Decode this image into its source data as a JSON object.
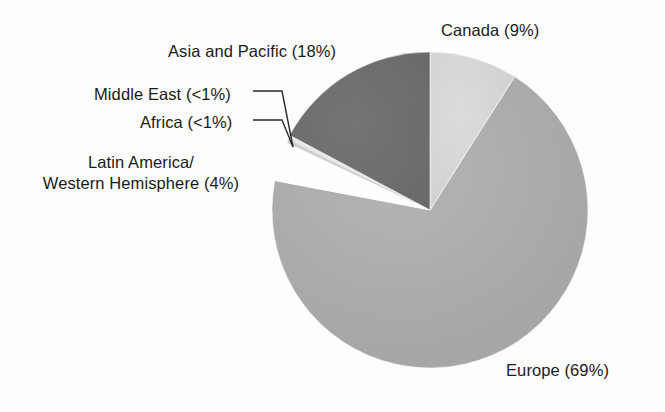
{
  "chart_data": {
    "type": "pie",
    "title": "",
    "subtitle": "",
    "xlabel": "",
    "ylabel": "",
    "legend_position": "outside-labels",
    "grid": false,
    "start_angle_deg": 0,
    "direction": "clockwise",
    "categories": [
      "Canada",
      "Europe",
      "Latin America/Western Hemisphere",
      "Africa",
      "Middle East",
      "Asia and Pacific"
    ],
    "values": [
      9,
      69,
      4,
      0.5,
      0.5,
      18
    ],
    "value_display": [
      "9%",
      "69%",
      "4%",
      "<1%",
      "<1%",
      "18%"
    ],
    "slices": [
      {
        "name": "Canada",
        "label": "Canada (9%)",
        "value": 9,
        "value_text": "9%",
        "color": "#d5d5d5",
        "start_deg": 0,
        "end_deg": 32.4
      },
      {
        "name": "Europe",
        "label": "Europe (69%)",
        "value": 69,
        "value_text": "69%",
        "color": "#acacac",
        "start_deg": 32.4,
        "end_deg": 280.8
      },
      {
        "name": "Latin America/Western Hemisphere",
        "label_line1": "Latin America/",
        "label_line2": "Western Hemisphere (4%)",
        "value": 4,
        "value_text": "4%",
        "color": "#fefefe",
        "start_deg": 280.8,
        "end_deg": 295.2
      },
      {
        "name": "Africa",
        "label": "Africa (<1%)",
        "value": 0.5,
        "value_text": "<1%",
        "color": "#cfcfcf",
        "start_deg": 295.2,
        "end_deg": 296.6
      },
      {
        "name": "Middle East",
        "label": "Middle East (<1%)",
        "value": 0.5,
        "value_text": "<1%",
        "color": "#e8e8e8",
        "start_deg": 296.6,
        "end_deg": 298.0
      },
      {
        "name": "Asia and Pacific",
        "label": "Asia and Pacific (18%)",
        "value": 18,
        "value_text": "18%",
        "color": "#6e6e6e",
        "start_deg": 298.0,
        "end_deg": 360
      }
    ],
    "geometry": {
      "center_x": 430,
      "center_y": 210,
      "radius": 158
    },
    "colors": {
      "background": "#fdfdfd",
      "text": "#1a1a1a",
      "leader_line": "#2a2a2a",
      "canada": "#d5d5d5",
      "europe": "#acacac",
      "latin_america": "#fefefe",
      "africa": "#cfcfcf",
      "middle_east": "#e8e8e8",
      "asia_pacific": "#6e6e6e"
    }
  },
  "labels": {
    "canada": "Canada (9%)",
    "asia_pacific": "Asia and Pacific (18%)",
    "middle_east": "Middle East (<1%)",
    "africa": "Africa (<1%)",
    "latin_america_line1": "Latin America/",
    "latin_america_line2": "Western Hemisphere (4%)",
    "europe": "Europe (69%)"
  }
}
